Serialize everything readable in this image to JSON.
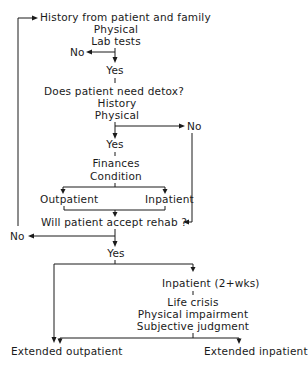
{
  "flowchart": {
    "nodes": {
      "assessment": {
        "lines": [
          "History from patient and family",
          "Physical",
          "Lab tests"
        ]
      },
      "assessment_no": "No",
      "assessment_yes": "Yes",
      "detox_question": {
        "lines": [
          "Does patient need detox?",
          "History",
          "Physical"
        ]
      },
      "detox_no": "No",
      "detox_yes": "Yes",
      "detox_criteria": {
        "lines": [
          "Finances",
          "Condition"
        ]
      },
      "detox_outpatient": "Outpatient",
      "detox_inpatient": "Inpatient",
      "rehab_question": "Will patient accept rehab ?",
      "rehab_no": "No",
      "rehab_yes": "Yes",
      "rehab_inpatient": "Inpatient (2+wks)",
      "rehab_criteria": {
        "lines": [
          "Life crisis",
          "Physical impairment",
          "Subjective judgment"
        ]
      },
      "extended_outpatient": "Extended outpatient",
      "extended_inpatient": "Extended inpatient"
    },
    "colors": {
      "ink": "#1a1a1a",
      "background": "#ffffff"
    }
  }
}
